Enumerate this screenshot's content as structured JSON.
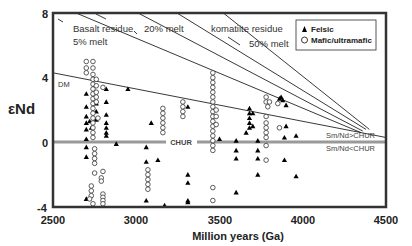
{
  "chart_data": {
    "type": "scatter",
    "title": "",
    "xlabel": "Million years (Ga)",
    "ylabel": "εNd",
    "xlim": [
      2500,
      4500
    ],
    "ylim": [
      -4,
      8
    ],
    "xticks": [
      2500,
      3000,
      3500,
      4000,
      4500
    ],
    "yticks": [
      -4,
      0,
      4,
      8
    ],
    "grid": false,
    "legend": {
      "position": "top-right",
      "entries": [
        {
          "label": "Felsic",
          "marker": "filled-triangle"
        },
        {
          "label": "Mafic/ultramafic",
          "marker": "open-circle"
        }
      ]
    },
    "reference_lines": [
      {
        "name": "CHUR",
        "y": 0,
        "label": "CHUR",
        "color": "#999999"
      },
      {
        "name": "DM",
        "from": [
          2500,
          4.3
        ],
        "to": [
          4500,
          0.3
        ],
        "label": "DM"
      },
      {
        "name": "Basalt residue 5% melt",
        "from": [
          2500,
          8.6
        ],
        "to": [
          4350,
          0.6
        ]
      },
      {
        "name": "Basalt residue 20% melt",
        "from": [
          2900,
          8.6
        ],
        "to": [
          4360,
          0.7
        ]
      },
      {
        "name": "Komatiite residue 50% melt",
        "from": [
          3150,
          8.6
        ],
        "to": [
          4380,
          0.8
        ]
      },
      {
        "name": "steep line",
        "from": [
          3450,
          8.6
        ],
        "to": [
          4400,
          0.8
        ]
      }
    ],
    "annotations": [
      {
        "text": "Basalt residue",
        "x": 2640,
        "y": 7.1
      },
      {
        "text": "20% melt",
        "x": 3020,
        "y": 7.1
      },
      {
        "text": "komatiite residue",
        "x": 3305,
        "y": 7.1
      },
      {
        "text": "5% melt",
        "x": 2640,
        "y": 6.0
      },
      {
        "text": "50% melt",
        "x": 3650,
        "y": 6.0
      },
      {
        "text": "DM",
        "x": 2515,
        "y": 3.5
      },
      {
        "text": "Sm/Nd>CHUR",
        "x": 4130,
        "y": 0.55
      },
      {
        "text": "Sm/Nd<CHUR",
        "x": 4130,
        "y": -0.75
      }
    ],
    "series": [
      {
        "name": "Felsic",
        "marker": "filled-triangle",
        "points": [
          [
            2700,
            3.0
          ],
          [
            2700,
            2.2
          ],
          [
            2700,
            1.6
          ],
          [
            2700,
            1.2
          ],
          [
            2700,
            0.8
          ],
          [
            2700,
            0.2
          ],
          [
            2700,
            -0.3
          ],
          [
            2700,
            -0.9
          ],
          [
            2700,
            -3.5
          ],
          [
            2720,
            1.3
          ],
          [
            2730,
            0.9
          ],
          [
            2760,
            2.4
          ],
          [
            2760,
            1.9
          ],
          [
            2760,
            1.4
          ],
          [
            2820,
            3.3
          ],
          [
            2820,
            2.5
          ],
          [
            2820,
            1.7
          ],
          [
            2820,
            1.2
          ],
          [
            2820,
            0.9
          ],
          [
            2820,
            0.6
          ],
          [
            2820,
            0.4
          ],
          [
            2950,
            3.3
          ],
          [
            2880,
            -0.1
          ],
          [
            3090,
            1.2
          ],
          [
            3060,
            -0.3
          ],
          [
            3060,
            -1.2
          ],
          [
            3060,
            -3.6
          ],
          [
            3130,
            -1.1
          ],
          [
            3170,
            -3.9
          ],
          [
            3310,
            2.2
          ],
          [
            3310,
            -2.0
          ],
          [
            3310,
            -2.5
          ],
          [
            3310,
            -3.6
          ],
          [
            3310,
            -3.7
          ],
          [
            3500,
            0.2
          ],
          [
            3600,
            0.1
          ],
          [
            3600,
            -0.5
          ],
          [
            3600,
            -1.0
          ],
          [
            3600,
            -3.1
          ],
          [
            3680,
            2.1
          ],
          [
            3680,
            1.8
          ],
          [
            3680,
            1.5
          ],
          [
            3680,
            1.2
          ],
          [
            3680,
            0.9
          ],
          [
            3660,
            0.6
          ],
          [
            3700,
            1.8
          ],
          [
            3700,
            1.0
          ],
          [
            3730,
            0.1
          ],
          [
            3730,
            -0.5
          ],
          [
            3730,
            -1.0
          ],
          [
            3730,
            -2.0
          ],
          [
            3880,
            2.6
          ],
          [
            3870,
            2.8
          ],
          [
            3860,
            2.7
          ],
          [
            3900,
            2.3
          ],
          [
            3900,
            1.0
          ],
          [
            3890,
            0.3
          ],
          [
            3890,
            -1.1
          ],
          [
            3960,
            0.4
          ],
          [
            3960,
            -2.1
          ]
        ]
      },
      {
        "name": "Mafic/ultramafic",
        "marker": "open-circle",
        "points": [
          [
            2700,
            5.0
          ],
          [
            2700,
            4.6
          ],
          [
            2700,
            4.3
          ],
          [
            2740,
            5.0
          ],
          [
            2740,
            4.6
          ],
          [
            2740,
            4.2
          ],
          [
            2740,
            3.9
          ],
          [
            2740,
            3.6
          ],
          [
            2740,
            3.3
          ],
          [
            2740,
            3.0
          ],
          [
            2740,
            2.7
          ],
          [
            2740,
            2.4
          ],
          [
            2740,
            2.1
          ],
          [
            2740,
            1.8
          ],
          [
            2740,
            1.5
          ],
          [
            2740,
            1.2
          ],
          [
            2740,
            0.9
          ],
          [
            2740,
            0.6
          ],
          [
            2740,
            0.3
          ],
          [
            2760,
            3.9
          ],
          [
            2760,
            3.5
          ],
          [
            2760,
            3.1
          ],
          [
            2760,
            2.8
          ],
          [
            2760,
            2.5
          ],
          [
            2800,
            3.4
          ],
          [
            2770,
            1.5
          ],
          [
            2750,
            -0.4
          ],
          [
            2750,
            -0.7
          ],
          [
            2750,
            -1.0
          ],
          [
            2750,
            -1.3
          ],
          [
            2750,
            -1.9
          ],
          [
            2730,
            -2.7
          ],
          [
            2730,
            -3.0
          ],
          [
            2730,
            -3.3
          ],
          [
            2720,
            -3.5
          ],
          [
            2740,
            -3.8
          ],
          [
            2800,
            -1.8
          ],
          [
            2790,
            -2.2
          ],
          [
            2790,
            -2.4
          ],
          [
            2800,
            -3.2
          ],
          [
            2800,
            -3.4
          ],
          [
            2800,
            -3.6
          ],
          [
            2800,
            -3.8
          ],
          [
            3070,
            -1.7
          ],
          [
            3070,
            -2.0
          ],
          [
            3070,
            -2.3
          ],
          [
            3070,
            -2.6
          ],
          [
            3070,
            -2.9
          ],
          [
            3160,
            2.1
          ],
          [
            3160,
            1.8
          ],
          [
            3160,
            1.5
          ],
          [
            3160,
            1.2
          ],
          [
            3160,
            0.9
          ],
          [
            3160,
            0.6
          ],
          [
            3280,
            2.5
          ],
          [
            3280,
            2.2
          ],
          [
            3280,
            1.9
          ],
          [
            3280,
            1.6
          ],
          [
            3460,
            4.3
          ],
          [
            3460,
            4.0
          ],
          [
            3460,
            3.7
          ],
          [
            3460,
            3.4
          ],
          [
            3460,
            3.1
          ],
          [
            3460,
            2.8
          ],
          [
            3460,
            2.5
          ],
          [
            3460,
            2.2
          ],
          [
            3460,
            1.9
          ],
          [
            3460,
            1.6
          ],
          [
            3460,
            1.3
          ],
          [
            3460,
            1.0
          ],
          [
            3460,
            0.7
          ],
          [
            3460,
            0.4
          ],
          [
            3460,
            0.1
          ],
          [
            3460,
            -0.2
          ],
          [
            3460,
            -0.5
          ],
          [
            3480,
            2.0
          ],
          [
            3480,
            1.6
          ],
          [
            3480,
            1.1
          ],
          [
            3460,
            -2.8
          ],
          [
            3460,
            -3.6
          ],
          [
            3780,
            2.8
          ],
          [
            3780,
            2.5
          ],
          [
            3790,
            2.2
          ],
          [
            3780,
            1.6
          ],
          [
            3780,
            1.2
          ],
          [
            3780,
            0.9
          ],
          [
            3780,
            0.6
          ],
          [
            3780,
            0.3
          ],
          [
            3780,
            -0.2
          ],
          [
            3780,
            -1.1
          ],
          [
            3800,
            2.5
          ],
          [
            3850,
            2.4
          ],
          [
            3860,
            0.9
          ]
        ]
      }
    ]
  },
  "legend": {
    "felsic_label": "Felsic",
    "mafic_label": "Mafic/ultramafic"
  },
  "axes": {
    "xlabel": "Million years (Ga)",
    "ylabel": "εNd",
    "xticks": [
      "2500",
      "3000",
      "3500",
      "4000",
      "4500"
    ],
    "yticks": [
      "8",
      "4",
      "0",
      "-4"
    ]
  },
  "labels": {
    "basalt_residue": "Basalt residue",
    "melt_20": "20% melt",
    "komatiite_residue": "komatiite residue",
    "melt_5": "5% melt",
    "melt_50": "50% melt",
    "dm": "DM",
    "chur": "CHUR",
    "sm_nd_gt": "Sm/Nd>CHUR",
    "sm_nd_lt": "Sm/Nd<CHUR"
  }
}
